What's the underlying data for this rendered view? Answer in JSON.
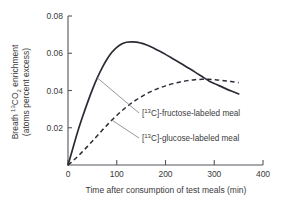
{
  "chart_data": {
    "type": "line",
    "title": "",
    "xlabel": "Time after consumption of test meals (min)",
    "ylabel": "Breath 13CO2 enrichment (atoms percent excess)",
    "ylabel_line1_pre": "Breath ",
    "ylabel_line1_sup": "13",
    "ylabel_line1_mid": "CO",
    "ylabel_line1_sub": "2",
    "ylabel_line1_post": " enrichment",
    "ylabel_line2": "(atoms percent excess)",
    "xlim": [
      0,
      400
    ],
    "ylim": [
      0,
      0.08
    ],
    "xticks": [
      0,
      100,
      200,
      300,
      400
    ],
    "xtick_labels": [
      "0",
      "100",
      "200",
      "300",
      "400"
    ],
    "yticks": [
      0,
      0.02,
      0.04,
      0.06,
      0.08
    ],
    "ytick_labels": [
      "0",
      "0.02",
      "0.04",
      "0.06",
      "0.08"
    ],
    "grid": false,
    "legend_position": "inline-annotations",
    "series": [
      {
        "name": "[13C]-fructose-labeled meal",
        "style": "solid",
        "color": "#2b2b36",
        "x": [
          0,
          10,
          20,
          30,
          40,
          50,
          60,
          70,
          80,
          90,
          100,
          110,
          120,
          130,
          140,
          150,
          160,
          170,
          180,
          190,
          200,
          215,
          230,
          245,
          260,
          275,
          290,
          305,
          320,
          335,
          350
        ],
        "values": [
          0.0,
          0.009,
          0.018,
          0.026,
          0.0335,
          0.0405,
          0.0468,
          0.0522,
          0.0568,
          0.0605,
          0.0632,
          0.065,
          0.0659,
          0.0661,
          0.066,
          0.0654,
          0.0646,
          0.0635,
          0.0622,
          0.0608,
          0.0594,
          0.0571,
          0.0548,
          0.0524,
          0.05,
          0.0475,
          0.045,
          0.0432,
          0.0414,
          0.0397,
          0.0382
        ]
      },
      {
        "name": "[13C]-glucose-labeled meal",
        "style": "dashed",
        "color": "#2b2b36",
        "x": [
          0,
          10,
          20,
          30,
          40,
          50,
          60,
          70,
          80,
          90,
          100,
          110,
          120,
          130,
          140,
          150,
          160,
          170,
          180,
          190,
          200,
          215,
          230,
          245,
          260,
          275,
          290,
          305,
          320,
          335,
          350
        ],
        "values": [
          0.0,
          0.0022,
          0.0046,
          0.0072,
          0.01,
          0.0128,
          0.0157,
          0.0186,
          0.0214,
          0.0241,
          0.0266,
          0.029,
          0.0312,
          0.0332,
          0.035,
          0.0366,
          0.0381,
          0.0394,
          0.0406,
          0.0416,
          0.0425,
          0.0437,
          0.0446,
          0.0453,
          0.0458,
          0.046,
          0.046,
          0.0457,
          0.0453,
          0.0448,
          0.0442
        ]
      }
    ],
    "annotations": [
      {
        "id": "fructose-annotation",
        "text_pre": "[",
        "text_sup": "13",
        "text_post": "C]-fructose-labeled meal",
        "full_text": "[13C]-fructose-labeled meal",
        "leader_from_x": 60,
        "leader_from_y": 0.0468
      },
      {
        "id": "glucose-annotation",
        "text_pre": "[",
        "text_sup": "13",
        "text_post": "C]-glucose-labeled meal",
        "full_text": "[13C]-glucose-labeled meal",
        "leader_from_x": 90,
        "leader_from_y": 0.0241
      }
    ],
    "axis_color": "#55555d",
    "leader_color": "#8a8a92"
  }
}
